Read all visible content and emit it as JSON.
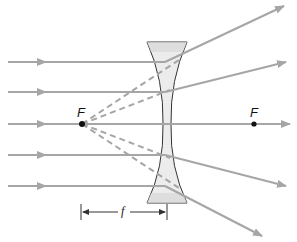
{
  "diagram": {
    "type": "diverging-lens-ray-diagram",
    "labels": {
      "left_focal_point": "F",
      "right_focal_point": "F",
      "focal_length": "f"
    },
    "colors": {
      "ray": "#a6a6a6",
      "lens_fill": "#ececec",
      "lens_stroke": "#333333",
      "focal_point": "#111111",
      "dimension_line": "#333333"
    },
    "incident_rays_y": [
      62,
      92,
      124,
      155,
      186
    ],
    "lens": {
      "top_y": 42,
      "bottom_y": 203,
      "center_x": 167
    },
    "focal_points": {
      "left": [
        82,
        124
      ],
      "right": [
        254,
        124
      ]
    }
  }
}
